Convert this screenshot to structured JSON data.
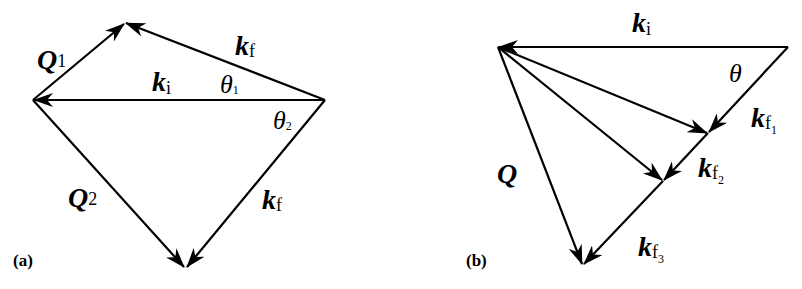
{
  "figure": {
    "background": "#ffffff",
    "ink_color": "#000000",
    "panels": [
      {
        "id": "a",
        "label": "(a)",
        "vectors": [
          {
            "name": "ki",
            "symbol": "k",
            "subscript": "i",
            "from": [
              325,
              100
            ],
            "to": [
              33,
              100
            ]
          },
          {
            "name": "Q1",
            "symbol": "Q",
            "subscript": "1",
            "from": [
              33,
              100
            ],
            "to": [
              125,
              23
            ]
          },
          {
            "name": "kf-upper",
            "symbol": "k",
            "subscript": "f",
            "from": [
              325,
              100
            ],
            "to": [
              125,
              23
            ]
          },
          {
            "name": "Q2",
            "symbol": "Q",
            "subscript": "2",
            "from": [
              33,
              100
            ],
            "to": [
              185,
              268
            ]
          },
          {
            "name": "kf-lower",
            "symbol": "k",
            "subscript": "f",
            "from": [
              325,
              100
            ],
            "to": [
              185,
              268
            ]
          }
        ],
        "angles": [
          {
            "symbol": "θ",
            "subscript": "1"
          },
          {
            "symbol": "θ",
            "subscript": "2"
          }
        ]
      },
      {
        "id": "b",
        "label": "(b)",
        "vectors": [
          {
            "name": "ki",
            "symbol": "k",
            "subscript": "i",
            "from": [
              788,
              47
            ],
            "to": [
              498,
              47
            ]
          },
          {
            "name": "kf1",
            "symbol": "k",
            "subscript": "f",
            "subsubscript": "1",
            "from": [
              788,
              47
            ],
            "to": [
              708,
              133
            ]
          },
          {
            "name": "kf2",
            "symbol": "k",
            "subscript": "f",
            "subsubscript": "2",
            "from": [
              708,
              133
            ],
            "to": [
              663,
              181
            ]
          },
          {
            "name": "kf3",
            "symbol": "k",
            "subscript": "f",
            "subsubscript": "3",
            "from": [
              663,
              181
            ],
            "to": [
              583,
              265
            ]
          },
          {
            "name": "Q-to-kf1",
            "from": [
              498,
              47
            ],
            "to": [
              708,
              133
            ]
          },
          {
            "name": "Q-to-kf2",
            "from": [
              498,
              47
            ],
            "to": [
              663,
              181
            ]
          },
          {
            "name": "Q",
            "symbol": "Q",
            "from": [
              498,
              47
            ],
            "to": [
              583,
              265
            ]
          }
        ],
        "angles": [
          {
            "symbol": "θ"
          }
        ]
      }
    ]
  },
  "labels": {
    "a": {
      "panel": "(a)",
      "Q1": {
        "main": "Q",
        "sub": "1"
      },
      "ki": {
        "main": "k",
        "sub": "i"
      },
      "kf_upper": {
        "main": "k",
        "sub": "f"
      },
      "theta1": {
        "main": "θ",
        "sub": "1"
      },
      "theta2": {
        "main": "θ",
        "sub": "2"
      },
      "Q2": {
        "main": "Q",
        "sub": "2"
      },
      "kf_lower": {
        "main": "k",
        "sub": "f"
      }
    },
    "b": {
      "panel": "(b)",
      "ki": {
        "main": "k",
        "sub": "i"
      },
      "theta": {
        "main": "θ"
      },
      "kf1": {
        "main": "k",
        "sub": "f",
        "subsub": "1"
      },
      "kf2": {
        "main": "k",
        "sub": "f",
        "subsub": "2"
      },
      "kf3": {
        "main": "k",
        "sub": "f",
        "subsub": "3"
      },
      "Q": {
        "main": "Q"
      }
    }
  }
}
